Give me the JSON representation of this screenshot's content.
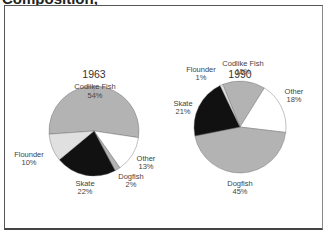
{
  "title": "Composition,",
  "chart_data": [
    {
      "type": "pie",
      "title": "1963",
      "slices": [
        {
          "label": "Codlike Fish",
          "value": 54,
          "color": "#b3b3b3"
        },
        {
          "label": "Other",
          "value": 13,
          "color": "#ffffff"
        },
        {
          "label": "Dogfish",
          "value": 2,
          "color": "#b3b3b3"
        },
        {
          "label": "Skate",
          "value": 22,
          "color": "#111111"
        },
        {
          "label": "Flounder",
          "value": 10,
          "color": "#e0e0e0"
        }
      ]
    },
    {
      "type": "pie",
      "title": "1990",
      "slices": [
        {
          "label": "Codlike Fish",
          "value": 15,
          "color": "#b3b3b3"
        },
        {
          "label": "Other",
          "value": 18,
          "color": "#ffffff"
        },
        {
          "label": "Dogfish",
          "value": 45,
          "color": "#b3b3b3"
        },
        {
          "label": "Skate",
          "value": 21,
          "color": "#111111"
        },
        {
          "label": "Flounder",
          "value": 1,
          "color": "#e0e0e0"
        }
      ]
    }
  ],
  "labels": {
    "p1": {
      "year": "1963",
      "codlike": "Codlike Fish",
      "codlike_pct": "54%",
      "other": "Other",
      "other_pct": "13%",
      "dogfish": "Dogfish",
      "dogfish_pct": "2%",
      "skate": "Skate",
      "skate_pct": "22%",
      "flounder": "Flounder",
      "flounder_pct": "10%"
    },
    "p2": {
      "year": "1990",
      "codlike": "Codlike Fish",
      "codlike_pct": "15%",
      "other": "Other",
      "other_pct": "18%",
      "dogfish": "Dogfish",
      "dogfish_pct": "45%",
      "skate": "Skate",
      "skate_pct": "21%",
      "flounder": "Flounder",
      "flounder_pct": "1%"
    }
  }
}
